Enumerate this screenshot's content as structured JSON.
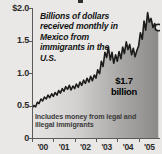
{
  "chart_data": {
    "type": "area",
    "title": "",
    "caption": "Billions of dollars received monthly in Mexico from immigrants in the U.S.",
    "footnote": "Includes money from legal and illegal immigrants",
    "annotation": {
      "value_label": "$1.7",
      "unit_label": "billion",
      "end_value": 1.7
    },
    "xlabel": "",
    "ylabel": "",
    "ylim": [
      0,
      2.0
    ],
    "ytick_labels": [
      "$2.0",
      "1.5",
      "1.0",
      "0.5",
      "0"
    ],
    "ytick_values": [
      2.0,
      1.5,
      1.0,
      0.5,
      0
    ],
    "xtick_labels": [
      "'00",
      "'01",
      "'02",
      "'03",
      "'04",
      "'05"
    ],
    "xtick_values": [
      2000,
      2001,
      2002,
      2003,
      2004,
      2005
    ],
    "grid": false,
    "legend": "none",
    "series": [
      {
        "name": "Monthly remittances to Mexico (billions of dollars)",
        "x": [
          2000.0,
          2000.08,
          2000.17,
          2000.25,
          2000.33,
          2000.42,
          2000.5,
          2000.58,
          2000.67,
          2000.75,
          2000.83,
          2000.92,
          2001.0,
          2001.08,
          2001.17,
          2001.25,
          2001.33,
          2001.42,
          2001.5,
          2001.58,
          2001.67,
          2001.75,
          2001.83,
          2001.92,
          2002.0,
          2002.08,
          2002.17,
          2002.25,
          2002.33,
          2002.42,
          2002.5,
          2002.58,
          2002.67,
          2002.75,
          2002.83,
          2002.92,
          2003.0,
          2003.08,
          2003.17,
          2003.25,
          2003.33,
          2003.42,
          2003.5,
          2003.58,
          2003.67,
          2003.75,
          2003.83,
          2003.92,
          2004.0,
          2004.08,
          2004.17,
          2004.25,
          2004.33,
          2004.42,
          2004.5,
          2004.58,
          2004.67,
          2004.75,
          2004.83,
          2004.92,
          2005.0,
          2005.08,
          2005.17,
          2005.25,
          2005.33,
          2005.42,
          2005.5,
          2005.58,
          2005.67,
          2005.75,
          2005.83,
          2005.92
        ],
        "values": [
          0.45,
          0.5,
          0.48,
          0.55,
          0.53,
          0.6,
          0.57,
          0.63,
          0.6,
          0.66,
          0.62,
          0.68,
          0.64,
          0.7,
          0.66,
          0.73,
          0.69,
          0.76,
          0.72,
          0.79,
          0.75,
          0.81,
          0.74,
          0.8,
          0.76,
          0.83,
          0.78,
          0.86,
          0.81,
          0.89,
          0.84,
          0.92,
          0.86,
          0.95,
          0.88,
          0.97,
          0.92,
          1.05,
          0.99,
          1.18,
          1.1,
          1.32,
          1.24,
          1.4,
          1.2,
          1.32,
          1.15,
          1.28,
          1.18,
          1.33,
          1.22,
          1.4,
          1.3,
          1.48,
          1.36,
          1.44,
          1.28,
          1.38,
          1.25,
          1.35,
          1.42,
          1.62,
          1.52,
          1.8,
          1.66,
          1.93,
          1.78,
          1.84,
          1.7,
          1.76,
          1.68,
          1.7
        ]
      }
    ]
  },
  "axis": {
    "ytick_labels": [
      "$2.0",
      "1.5",
      "1.0",
      "0.5",
      "0"
    ],
    "xtick_labels": [
      "'00",
      "'01",
      "'02",
      "'03",
      "'04",
      "'05"
    ]
  },
  "caption": {
    "text": "Billions of dollars received monthly in Mexico from immigrants in the U.S."
  },
  "callout": {
    "value": "$1.7",
    "unit": "billion"
  },
  "footnote": {
    "text": "Includes money from legal and illegal immigrants"
  },
  "colors": {
    "background": "#e9e8e6",
    "line": "#1c1c1c",
    "fill_light": "#e3e2e0",
    "fill_dark": "#8f8f8d",
    "axis": "#5a5a5a",
    "text": "#141414"
  }
}
